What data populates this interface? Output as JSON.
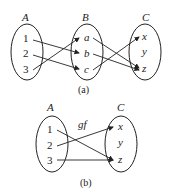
{
  "diagram_a": {
    "caption": "(a)",
    "sets": [
      {
        "name": "A",
        "elements": [
          "1",
          "2",
          "3"
        ]
      },
      {
        "name": "B",
        "elements": [
          "a",
          "b",
          "c"
        ]
      },
      {
        "name": "C",
        "elements": [
          "x",
          "y",
          "z"
        ]
      }
    ],
    "mappings": [
      {
        "from": "1",
        "to": "b",
        "function": "f"
      },
      {
        "from": "2",
        "to": "c",
        "function": "f"
      },
      {
        "from": "3",
        "to": "a",
        "function": "f"
      },
      {
        "from": "a",
        "to": "z",
        "function": "g"
      },
      {
        "from": "b",
        "to": "z",
        "function": "g"
      },
      {
        "from": "c",
        "to": "x",
        "function": "g"
      }
    ]
  },
  "diagram_b": {
    "caption": "(b)",
    "function_label": "gf",
    "sets": [
      {
        "name": "A",
        "elements": [
          "1",
          "2",
          "3"
        ]
      },
      {
        "name": "C",
        "elements": [
          "x",
          "y",
          "z"
        ]
      }
    ],
    "mappings": [
      {
        "from": "1",
        "to": "z"
      },
      {
        "from": "2",
        "to": "x"
      },
      {
        "from": "3",
        "to": "z"
      }
    ]
  }
}
